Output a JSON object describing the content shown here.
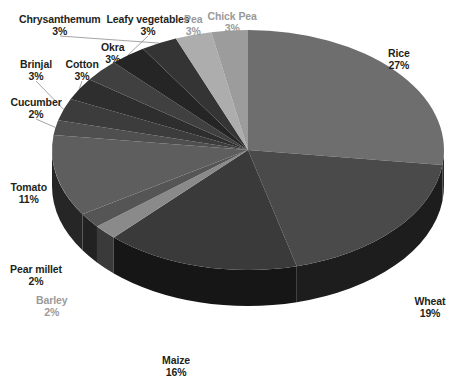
{
  "chart_data": {
    "type": "pie",
    "title": "",
    "subtitle": "",
    "xlabel": "",
    "ylabel": "",
    "legend_position": "none",
    "grid": false,
    "style": "3d-exploded-grayscale",
    "value_unit": "percent",
    "total": 100,
    "categories": [
      "Rice",
      "Wheat",
      "Maize",
      "Barley",
      "Pear millet",
      "Tomato",
      "Cucumber",
      "Brinjal",
      "Cotton",
      "Okra",
      "Leafy vegetables",
      "Chrysanthemum",
      "Pea",
      "Chick Pea"
    ],
    "values": [
      27,
      19,
      16,
      2,
      2,
      11,
      2,
      3,
      3,
      3,
      3,
      3,
      3,
      3
    ],
    "slices": [
      {
        "label": "Rice",
        "value": 27,
        "display": "27%",
        "color": "#6e6e6e",
        "side_color": "#2a2a2a",
        "label_color": "#231f20",
        "label_x": 399,
        "label_y": 48,
        "leader": false
      },
      {
        "label": "Wheat",
        "value": 19,
        "display": "19%",
        "color": "#4a4a4a",
        "side_color": "#1d1d1d",
        "label_color": "#231f20",
        "label_x": 430,
        "label_y": 296,
        "leader": false
      },
      {
        "label": "Maize",
        "value": 16,
        "display": "16%",
        "color": "#3a3a3a",
        "side_color": "#161616",
        "label_color": "#231f20",
        "label_x": 176,
        "label_y": 355,
        "leader": false
      },
      {
        "label": "Barley",
        "value": 2,
        "display": "2%",
        "color": "#8a8a8a",
        "side_color": "#3a3a3a",
        "label_color": "#9a9a9a",
        "label_x": 52,
        "label_y": 295,
        "leader": false
      },
      {
        "label": "Pear millet",
        "value": 2,
        "display": "2%",
        "color": "#555555",
        "side_color": "#222222",
        "label_color": "#231f20",
        "label_x": 36,
        "label_y": 264,
        "leader": false
      },
      {
        "label": "Tomato",
        "value": 11,
        "display": "11%",
        "color": "#5e5e5e",
        "side_color": "#262626",
        "label_color": "#231f20",
        "label_x": 29,
        "label_y": 182,
        "leader": false
      },
      {
        "label": "Cucumber",
        "value": 2,
        "display": "2%",
        "color": "#4f4f4f",
        "side_color": "#202020",
        "label_color": "#231f20",
        "label_x": 36,
        "label_y": 97,
        "leader": true
      },
      {
        "label": "Brinjal",
        "value": 3,
        "display": "3%",
        "color": "#3c3c3c",
        "side_color": "#181818",
        "label_color": "#231f20",
        "label_x": 36,
        "label_y": 59,
        "leader": true
      },
      {
        "label": "Cotton",
        "value": 3,
        "display": "3%",
        "color": "#2e2e2e",
        "side_color": "#131313",
        "label_color": "#231f20",
        "label_x": 82,
        "label_y": 59,
        "leader": true
      },
      {
        "label": "Okra",
        "value": 3,
        "display": "3%",
        "color": "#404040",
        "side_color": "#191919",
        "label_color": "#231f20",
        "label_x": 113,
        "label_y": 42,
        "leader": false
      },
      {
        "label": "Leafy vegetables",
        "value": 3,
        "display": "3%",
        "color": "#252525",
        "side_color": "#101010",
        "label_color": "#231f20",
        "label_x": 148,
        "label_y": 14,
        "leader": true
      },
      {
        "label": "Chrysanthemum",
        "value": 3,
        "display": "3%",
        "color": "#343434",
        "side_color": "#151515",
        "label_color": "#231f20",
        "label_x": 60,
        "label_y": 14,
        "leader": true
      },
      {
        "label": "Pea",
        "value": 3,
        "display": "3%",
        "color": "#adadad",
        "side_color": "#4a4a4a",
        "label_color": "#9a9a9a",
        "label_x": 193,
        "label_y": 14,
        "leader": false
      },
      {
        "label": "Chick Pea",
        "value": 3,
        "display": "3%",
        "color": "#9c9c9c",
        "side_color": "#434343",
        "label_color": "#9a9a9a",
        "label_x": 232,
        "label_y": 11,
        "leader": false
      }
    ],
    "geometry": {
      "center_x": 248,
      "center_y": 150,
      "radius_x": 196,
      "radius_y": 120,
      "depth": 36,
      "start_angle_deg": -90
    }
  }
}
